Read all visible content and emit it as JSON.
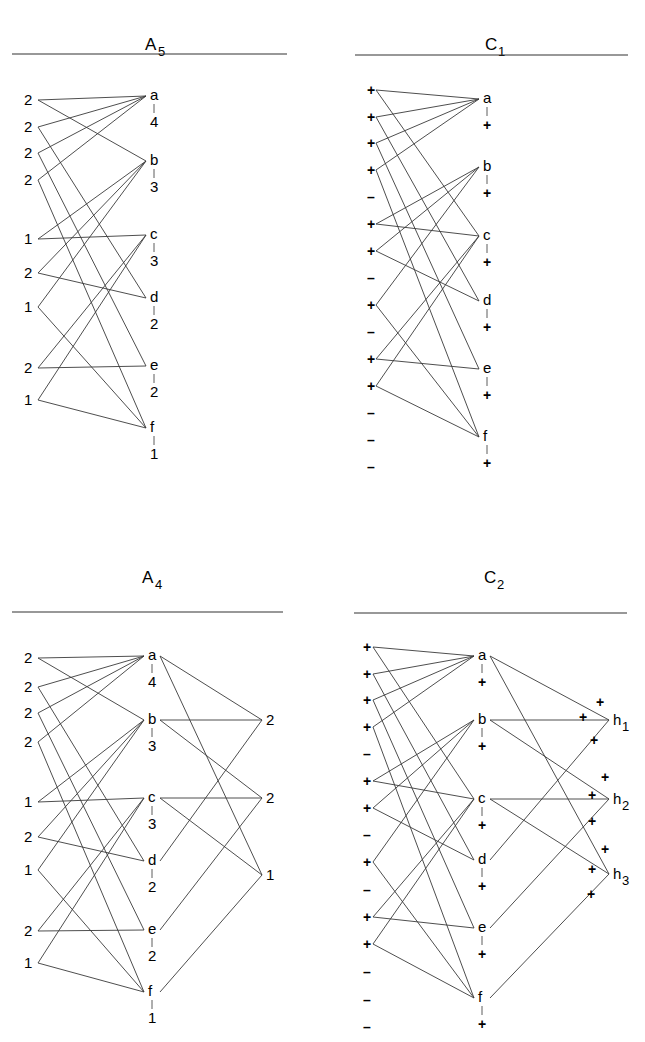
{
  "panels": [
    {
      "id": "A5",
      "title": "A",
      "subscript": "5",
      "title_x": 153,
      "title_y": 50,
      "rule": [
        12,
        287,
        54
      ],
      "left_x": 38,
      "left_label_x": 33,
      "mid_x": 150,
      "left_nodes": [
        {
          "label": "2",
          "y": 100
        },
        {
          "label": "2",
          "y": 127
        },
        {
          "label": "2",
          "y": 153
        },
        {
          "label": "2",
          "y": 180
        },
        {
          "label": "1",
          "y": 239
        },
        {
          "label": "2",
          "y": 273
        },
        {
          "label": "1",
          "y": 307
        },
        {
          "label": "2",
          "y": 368
        },
        {
          "label": "1",
          "y": 400
        }
      ],
      "mid_nodes": [
        {
          "label": "a",
          "y": 100,
          "value": "4"
        },
        {
          "label": "b",
          "y": 165,
          "value": "3"
        },
        {
          "label": "c",
          "y": 239,
          "value": "3"
        },
        {
          "label": "d",
          "y": 302,
          "value": "2"
        },
        {
          "label": "e",
          "y": 370,
          "value": "2"
        },
        {
          "label": "f",
          "y": 432,
          "value": "1"
        }
      ],
      "edges": [
        [
          0,
          0
        ],
        [
          0,
          1
        ],
        [
          1,
          0
        ],
        [
          1,
          3
        ],
        [
          2,
          0
        ],
        [
          2,
          4
        ],
        [
          3,
          0
        ],
        [
          3,
          5
        ],
        [
          4,
          1
        ],
        [
          4,
          2
        ],
        [
          5,
          1
        ],
        [
          5,
          3
        ],
        [
          6,
          1
        ],
        [
          6,
          5
        ],
        [
          7,
          2
        ],
        [
          7,
          4
        ],
        [
          8,
          2
        ],
        [
          8,
          5
        ]
      ],
      "right_nodes": [],
      "right_edges": []
    },
    {
      "id": "C1",
      "title": "C",
      "subscript": "1",
      "title_x": 493,
      "title_y": 50,
      "rule": [
        355,
        628,
        55
      ],
      "left_x": 376,
      "left_label_x": 371,
      "mid_x": 483,
      "left_nodes": [
        {
          "label": "+",
          "y": 90
        },
        {
          "label": "+",
          "y": 117
        },
        {
          "label": "+",
          "y": 143
        },
        {
          "label": "+",
          "y": 170
        },
        {
          "label": "–",
          "y": 197
        },
        {
          "label": "+",
          "y": 224
        },
        {
          "label": "+",
          "y": 251
        },
        {
          "label": "–",
          "y": 278
        },
        {
          "label": "+",
          "y": 305
        },
        {
          "label": "–",
          "y": 332
        },
        {
          "label": "+",
          "y": 359
        },
        {
          "label": "+",
          "y": 386
        },
        {
          "label": "–",
          "y": 413
        },
        {
          "label": "–",
          "y": 440
        },
        {
          "label": "–",
          "y": 467
        }
      ],
      "mid_nodes": [
        {
          "label": "a",
          "y": 103,
          "value": "+"
        },
        {
          "label": "b",
          "y": 171,
          "value": "+"
        },
        {
          "label": "c",
          "y": 240,
          "value": "+"
        },
        {
          "label": "d",
          "y": 305,
          "value": "+"
        },
        {
          "label": "e",
          "y": 373,
          "value": "+"
        },
        {
          "label": "f",
          "y": 441,
          "value": "+"
        }
      ],
      "edges": [
        [
          0,
          0
        ],
        [
          0,
          2
        ],
        [
          1,
          0
        ],
        [
          1,
          3
        ],
        [
          2,
          0
        ],
        [
          2,
          4
        ],
        [
          3,
          0
        ],
        [
          3,
          5
        ],
        [
          5,
          1
        ],
        [
          5,
          2
        ],
        [
          6,
          1
        ],
        [
          6,
          3
        ],
        [
          8,
          1
        ],
        [
          8,
          5
        ],
        [
          10,
          2
        ],
        [
          10,
          4
        ],
        [
          11,
          2
        ],
        [
          11,
          5
        ]
      ],
      "right_nodes": [],
      "right_edges": []
    },
    {
      "id": "A4",
      "title": "A",
      "subscript": "4",
      "title_x": 150,
      "title_y": 583,
      "rule": [
        12,
        283,
        612
      ],
      "left_x": 38,
      "left_label_x": 33,
      "mid_x": 148,
      "left_nodes": [
        {
          "label": "2",
          "y": 658
        },
        {
          "label": "2",
          "y": 687
        },
        {
          "label": "2",
          "y": 713
        },
        {
          "label": "2",
          "y": 742
        },
        {
          "label": "1",
          "y": 802
        },
        {
          "label": "2",
          "y": 837
        },
        {
          "label": "1",
          "y": 870
        },
        {
          "label": "2",
          "y": 931
        },
        {
          "label": "1",
          "y": 963
        }
      ],
      "mid_nodes": [
        {
          "label": "a",
          "y": 660,
          "value": "4"
        },
        {
          "label": "b",
          "y": 724,
          "value": "3"
        },
        {
          "label": "c",
          "y": 802,
          "value": "3"
        },
        {
          "label": "d",
          "y": 865,
          "value": "2"
        },
        {
          "label": "e",
          "y": 934,
          "value": "2"
        },
        {
          "label": "f",
          "y": 996,
          "value": "1"
        }
      ],
      "edges": [
        [
          0,
          0
        ],
        [
          0,
          1
        ],
        [
          1,
          0
        ],
        [
          1,
          3
        ],
        [
          2,
          0
        ],
        [
          2,
          4
        ],
        [
          3,
          0
        ],
        [
          3,
          5
        ],
        [
          4,
          1
        ],
        [
          4,
          2
        ],
        [
          5,
          1
        ],
        [
          5,
          3
        ],
        [
          6,
          1
        ],
        [
          6,
          5
        ],
        [
          7,
          2
        ],
        [
          7,
          4
        ],
        [
          8,
          2
        ],
        [
          8,
          5
        ]
      ],
      "right_x": 262,
      "right_nodes": [
        {
          "label": "2",
          "y": 724
        },
        {
          "label": "2",
          "y": 802
        },
        {
          "label": "1",
          "y": 879
        }
      ],
      "right_edges": [
        [
          0,
          0
        ],
        [
          0,
          2
        ],
        [
          1,
          0
        ],
        [
          1,
          1
        ],
        [
          2,
          1
        ],
        [
          2,
          2
        ],
        [
          3,
          0
        ],
        [
          4,
          1
        ],
        [
          5,
          2
        ]
      ]
    },
    {
      "id": "C2",
      "title": "C",
      "subscript": "2",
      "title_x": 492,
      "title_y": 583,
      "rule": [
        354,
        627,
        613
      ],
      "left_x": 373,
      "left_label_x": 367,
      "mid_x": 478,
      "left_nodes": [
        {
          "label": "+",
          "y": 647
        },
        {
          "label": "+",
          "y": 674
        },
        {
          "label": "+",
          "y": 700
        },
        {
          "label": "+",
          "y": 727
        },
        {
          "label": "–",
          "y": 754
        },
        {
          "label": "+",
          "y": 781
        },
        {
          "label": "+",
          "y": 808
        },
        {
          "label": "–",
          "y": 835
        },
        {
          "label": "+",
          "y": 862
        },
        {
          "label": "–",
          "y": 890
        },
        {
          "label": "+",
          "y": 917
        },
        {
          "label": "+",
          "y": 944
        },
        {
          "label": "–",
          "y": 972
        },
        {
          "label": "–",
          "y": 1000
        },
        {
          "label": "–",
          "y": 1027
        }
      ],
      "mid_nodes": [
        {
          "label": "a",
          "y": 660,
          "value": "+"
        },
        {
          "label": "b",
          "y": 724,
          "value": "+"
        },
        {
          "label": "c",
          "y": 803,
          "value": "+"
        },
        {
          "label": "d",
          "y": 864,
          "value": "+"
        },
        {
          "label": "e",
          "y": 932,
          "value": "+"
        },
        {
          "label": "f",
          "y": 1002,
          "value": "+"
        }
      ],
      "edges": [
        [
          0,
          0
        ],
        [
          0,
          2
        ],
        [
          1,
          0
        ],
        [
          1,
          3
        ],
        [
          2,
          0
        ],
        [
          2,
          4
        ],
        [
          3,
          0
        ],
        [
          3,
          5
        ],
        [
          5,
          1
        ],
        [
          5,
          2
        ],
        [
          6,
          1
        ],
        [
          6,
          3
        ],
        [
          8,
          1
        ],
        [
          8,
          5
        ],
        [
          10,
          2
        ],
        [
          10,
          4
        ],
        [
          11,
          2
        ],
        [
          11,
          5
        ]
      ],
      "right_x": 609,
      "right_nodes": [
        {
          "label": "h",
          "sub": "1",
          "y": 724
        },
        {
          "label": "h",
          "sub": "2",
          "y": 803
        },
        {
          "label": "h",
          "sub": "3",
          "y": 878
        }
      ],
      "right_edges": [
        [
          0,
          0
        ],
        [
          0,
          2
        ],
        [
          1,
          0
        ],
        [
          1,
          1
        ],
        [
          2,
          1
        ],
        [
          2,
          2
        ],
        [
          3,
          0
        ],
        [
          4,
          1
        ],
        [
          5,
          2
        ]
      ],
      "right_signs": [
        {
          "x": 596,
          "y": 707
        },
        {
          "x": 579,
          "y": 722
        },
        {
          "x": 590,
          "y": 745
        },
        {
          "x": 601,
          "y": 782
        },
        {
          "x": 588,
          "y": 800
        },
        {
          "x": 588,
          "y": 826
        },
        {
          "x": 601,
          "y": 854
        },
        {
          "x": 588,
          "y": 874
        },
        {
          "x": 587,
          "y": 899
        }
      ]
    }
  ]
}
